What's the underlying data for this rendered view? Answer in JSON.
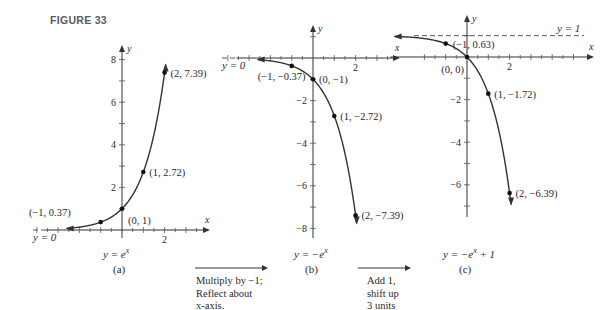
{
  "figure_title": "FIGURE 33",
  "chart_data": [
    {
      "type": "line",
      "id": "a",
      "panel_label": "(a)",
      "equation": "y = e^x",
      "function": "exp",
      "xlabel": "x",
      "ylabel": "y",
      "x_ticks_labeled": [
        2
      ],
      "y_ticks_labeled": [
        2,
        4,
        6,
        8
      ],
      "xlim": [
        -4.2,
        3.8
      ],
      "ylim": [
        -0.3,
        8.6
      ],
      "asymptote": {
        "label": "y = 0",
        "y": 0
      },
      "points": [
        {
          "x": -1,
          "y": 0.37,
          "label": "(−1, 0.37)"
        },
        {
          "x": 0,
          "y": 1,
          "label": "(0, 1)"
        },
        {
          "x": 1,
          "y": 2.72,
          "label": "(1, 2.72)"
        },
        {
          "x": 2,
          "y": 7.39,
          "label": "(2, 7.39)"
        }
      ],
      "curve_x_range": [
        -2.6,
        2.05
      ]
    },
    {
      "type": "line",
      "id": "b",
      "panel_label": "(b)",
      "equation": "y = −e^x",
      "function": "neg_exp",
      "xlabel": "x",
      "ylabel": "y",
      "x_ticks_labeled": [
        2
      ],
      "y_ticks_labeled": [
        -2,
        -4,
        -6,
        -8
      ],
      "xlim": [
        -4.2,
        3.8
      ],
      "ylim": [
        -8.4,
        0.7
      ],
      "asymptote": {
        "label": "y = 0",
        "y": 0
      },
      "points": [
        {
          "x": -1,
          "y": -0.37,
          "label": "(−1, −0.37)"
        },
        {
          "x": 0,
          "y": -1,
          "label": "(0, −1)"
        },
        {
          "x": 1,
          "y": -2.72,
          "label": "(1, −2.72)"
        },
        {
          "x": 2,
          "y": -7.39,
          "label": "(2, −7.39)"
        }
      ],
      "curve_x_range": [
        -2.6,
        2.05
      ]
    },
    {
      "type": "line",
      "id": "c",
      "panel_label": "(c)",
      "equation": "y = −e^x + 1",
      "function": "neg_exp_plus_1",
      "xlabel": "x",
      "ylabel": "y",
      "x_ticks_labeled": [
        2
      ],
      "y_ticks_labeled": [
        -2,
        -4,
        -6
      ],
      "xlim": [
        -4.2,
        5.6
      ],
      "ylim": [
        -7.4,
        1.5
      ],
      "asymptote": {
        "label": "y = 1",
        "y": 1,
        "style": "dashed"
      },
      "points": [
        {
          "x": -1,
          "y": 0.63,
          "label": "(−1, 0.63)"
        },
        {
          "x": 0,
          "y": 0,
          "label": "(0, 0)"
        },
        {
          "x": 1,
          "y": -1.72,
          "label": "(1, −1.72)"
        },
        {
          "x": 2,
          "y": -6.39,
          "label": "(2, −6.39)"
        }
      ],
      "curve_x_range": [
        -3.4,
        2.07
      ]
    }
  ],
  "transitions": [
    {
      "lines": [
        "Multiply by −1;",
        "Reflect about",
        "x-axis."
      ]
    },
    {
      "lines": [
        "Add 1,",
        "shift up",
        "3 units"
      ]
    }
  ],
  "panel_equations": {
    "a": {
      "pre": "y = e",
      "sup": "x",
      "post": ""
    },
    "b": {
      "pre": "y = −e",
      "sup": "x",
      "post": ""
    },
    "c": {
      "pre": "y = −e",
      "sup": "x",
      "post": " + 1"
    }
  }
}
